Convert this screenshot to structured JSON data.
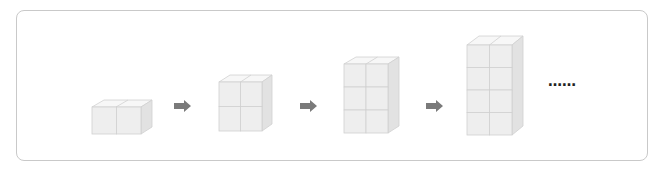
{
  "diagram": {
    "type": "block-sequence",
    "figures": [
      {
        "columns": 2,
        "layers": 1,
        "cubes": 2
      },
      {
        "columns": 2,
        "layers": 2,
        "cubes": 4
      },
      {
        "columns": 2,
        "layers": 3,
        "cubes": 6
      },
      {
        "columns": 2,
        "layers": 4,
        "cubes": 8
      }
    ],
    "connector_icon": "right-arrow-icon",
    "continuation": "……",
    "colors": {
      "cube_front": "#eeeeee",
      "cube_top": "#f7f7f7",
      "cube_side": "#e2e2e2",
      "cube_edge": "#cfcfcf",
      "arrow": "#7a7a7a",
      "frame_border": "#c9c9c9"
    }
  }
}
